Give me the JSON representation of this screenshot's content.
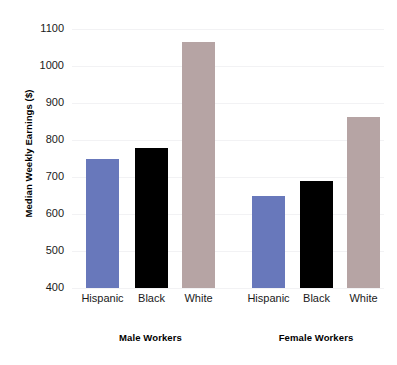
{
  "chart_data": {
    "type": "bar",
    "title": "",
    "xlabel": "",
    "ylabel": "Median Weekly Earnings ($)",
    "ylim": [
      400,
      1100
    ],
    "ytick_labels": [
      "1100",
      "1000",
      "900",
      "800",
      "700",
      "600",
      "500",
      "400"
    ],
    "yticks": [
      1100,
      1000,
      900,
      800,
      700,
      600,
      500,
      400
    ],
    "grid": true,
    "legend": "none",
    "categories": [
      "Hispanic",
      "Black",
      "White"
    ],
    "groups": [
      {
        "name": "Male Workers",
        "bars": [
          {
            "category": "Hispanic",
            "value": 750,
            "color": "#6878bb",
            "style": "blue"
          },
          {
            "category": "Black",
            "value": 778,
            "color": "#000000",
            "style": "black"
          },
          {
            "category": "White",
            "value": 1066,
            "color": "#b6a4a4",
            "style": "mauve"
          }
        ]
      },
      {
        "name": "Female Workers",
        "bars": [
          {
            "category": "Hispanic",
            "value": 650,
            "color": "#6878bb",
            "style": "blue"
          },
          {
            "category": "Black",
            "value": 688,
            "color": "#000000",
            "style": "black"
          },
          {
            "category": "White",
            "value": 862,
            "color": "#b6a4a4",
            "style": "mauve"
          }
        ]
      }
    ],
    "colors": {
      "hispanic": "#6878bb",
      "black": "#000000",
      "white": "#b6a4a4",
      "gridline": "#f2f2f4",
      "text": "#1a1a1a",
      "background": "#ffffff"
    }
  }
}
